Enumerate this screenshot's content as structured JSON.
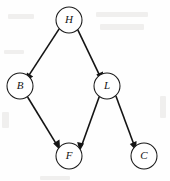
{
  "diagram": {
    "type": "directed-graph",
    "title": "",
    "width": 170,
    "height": 181,
    "background_color": "#fefefe",
    "node_fill_color": "#ffffff",
    "node_stroke_color": "#1a1a1a",
    "edge_color": "#141414",
    "label_style": "italic-serif",
    "nodes": [
      {
        "id": "H",
        "label": "H",
        "cx": 69,
        "cy": 20,
        "r": 13
      },
      {
        "id": "B",
        "label": "B",
        "cx": 20,
        "cy": 86,
        "r": 13
      },
      {
        "id": "L",
        "label": "L",
        "cx": 107,
        "cy": 86,
        "r": 13
      },
      {
        "id": "F",
        "label": "F",
        "cx": 69,
        "cy": 156,
        "r": 13
      },
      {
        "id": "C",
        "label": "C",
        "cx": 144,
        "cy": 156,
        "r": 13
      }
    ],
    "edges": [
      {
        "from": "H",
        "to": "B",
        "directed": true,
        "arrowhead": "filled"
      },
      {
        "from": "H",
        "to": "L",
        "directed": true,
        "arrowhead": "filled"
      },
      {
        "from": "B",
        "to": "F",
        "directed": true,
        "arrowhead": "filled"
      },
      {
        "from": "L",
        "to": "F",
        "directed": true,
        "arrowhead": "filled"
      },
      {
        "from": "L",
        "to": "C",
        "directed": true,
        "arrowhead": "filled"
      }
    ]
  }
}
